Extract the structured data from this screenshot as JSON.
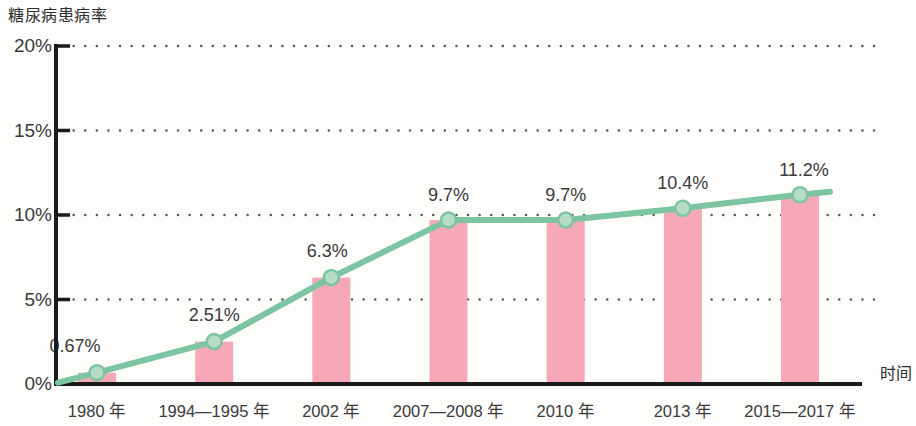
{
  "chart_data": {
    "type": "bar",
    "title": "",
    "ylabel": "糖尿病患病率",
    "xlabel": "时间",
    "categories": [
      "1980 年",
      "1994—1995 年",
      "2002 年",
      "2007—2008 年",
      "2010 年",
      "2013 年",
      "2015—2017 年"
    ],
    "values": [
      0.67,
      2.51,
      6.3,
      9.7,
      9.7,
      10.4,
      11.2
    ],
    "value_labels": [
      "0.67%",
      "2.51%",
      "6.3%",
      "9.7%",
      "9.7%",
      "10.4%",
      "11.2%"
    ],
    "series": [
      {
        "name": "糖尿病患病率（柱）",
        "type": "bar",
        "values": [
          0.67,
          2.51,
          6.3,
          9.7,
          9.7,
          10.4,
          11.2
        ]
      },
      {
        "name": "糖尿病患病率（折线）",
        "type": "line",
        "values": [
          0.67,
          2.51,
          6.3,
          9.7,
          9.7,
          10.4,
          11.2
        ]
      }
    ],
    "ylim": [
      0,
      20
    ],
    "yticks": [
      0,
      5,
      10,
      15,
      20
    ],
    "ytick_labels": [
      "0%",
      "5%",
      "10%",
      "15%",
      "20%"
    ],
    "grid": "horizontal-dotted",
    "legend": "none",
    "colors": {
      "bar": "#f6a8b8",
      "line": "#7cc4a2",
      "marker_fill": "#b6dcc8",
      "marker_stroke": "#7cc4a2",
      "axis": "#1a1a1a",
      "grid": "#555555",
      "text": "#3a3a3a",
      "background": "#fdfdfc"
    }
  }
}
